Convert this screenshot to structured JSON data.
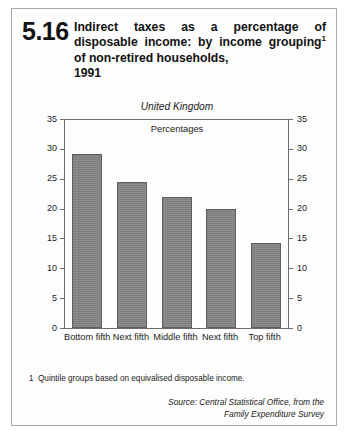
{
  "figure": {
    "number": "5.16",
    "title_line1": "Indirect taxes as a percentage of",
    "title_line2": "disposable income: by income",
    "title_line3_a": "grouping",
    "title_line3_sup": "1",
    "title_line3_b": " of non-retired households,",
    "title_line4": "1991"
  },
  "chart_data": {
    "type": "bar",
    "region": "United Kingdom",
    "units": "Percentages",
    "categories": [
      "Bottom fifth",
      "Next fifth",
      "Middle fifth",
      "Next fifth",
      "Top fifth"
    ],
    "values": [
      29.1,
      24.5,
      22.0,
      19.9,
      14.3
    ],
    "xlabel": "",
    "ylabel": "",
    "ylim": [
      0,
      35
    ],
    "yticks": [
      0,
      5,
      10,
      15,
      20,
      25,
      30,
      35
    ],
    "ytick_labels": [
      "0",
      "5",
      "10",
      "15",
      "20",
      "25",
      "30",
      "35"
    ],
    "right_axis": true,
    "right_ytick_labels": [
      "0",
      "5",
      "10",
      "15",
      "20",
      "25",
      "30",
      "35"
    ],
    "grid": false,
    "legend": "none",
    "bar_color": "#828282",
    "bar_edge_color": "#5e5e5e",
    "axis_color": "#6d6d6d"
  },
  "footnote": {
    "marker": "1",
    "text": "Quintile groups based on equivalised disposable income."
  },
  "source": {
    "line1": "Source: Central Statistical Office, from the",
    "line2": "Family Expenditure Survey"
  }
}
